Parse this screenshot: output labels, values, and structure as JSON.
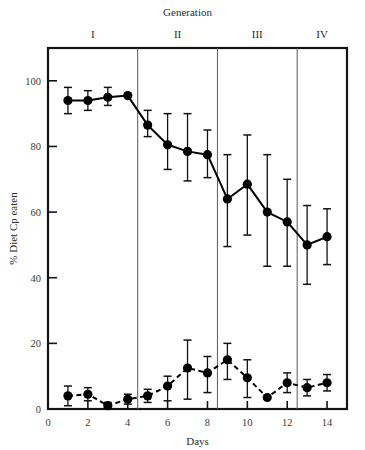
{
  "chart_data": {
    "type": "line",
    "title": "",
    "xlabel": "Days",
    "ylabel": "% Diet Cp eaten",
    "top_axis_title": "Generation",
    "xlim": [
      0,
      15
    ],
    "ylim": [
      0,
      110
    ],
    "xticks": [
      0,
      2,
      4,
      6,
      8,
      10,
      12,
      14
    ],
    "xtick_labels": [
      "0",
      "2",
      "4",
      "6",
      "8",
      "10",
      "12",
      "14"
    ],
    "yticks": [
      0,
      20,
      40,
      60,
      80,
      100
    ],
    "ytick_labels": [
      "0",
      "20",
      "40",
      "60",
      "80",
      "100"
    ],
    "grid": false,
    "legend": "none",
    "generations": [
      {
        "label": "I",
        "x_start": 0,
        "x_end": 4.5,
        "x_center": 2.25
      },
      {
        "label": "II",
        "x_start": 4.5,
        "x_end": 8.5,
        "x_center": 6.5
      },
      {
        "label": "III",
        "x_start": 8.5,
        "x_end": 12.5,
        "x_center": 10.5
      },
      {
        "label": "IV",
        "x_start": 12.5,
        "x_end": 15,
        "x_center": 13.75
      }
    ],
    "generation_dividers": [
      4.5,
      8.5,
      12.5
    ],
    "x": [
      1,
      2,
      3,
      4,
      5,
      6,
      7,
      8,
      9,
      10,
      11,
      12,
      13,
      14
    ],
    "series": [
      {
        "name": "upper",
        "linestyle": "solid",
        "marker": "filled-circle",
        "color": "#000000",
        "values": [
          94,
          94,
          95,
          95.5,
          86.5,
          80.5,
          78.5,
          77.5,
          64,
          68.5,
          60,
          57,
          50,
          52.5
        ],
        "err_low": [
          90,
          91,
          92.5,
          95.5,
          83,
          73,
          69.5,
          70.5,
          49.5,
          53,
          43.5,
          43.5,
          38,
          44
        ],
        "err_high": [
          98,
          97,
          98,
          95.5,
          91,
          90,
          90,
          85,
          77.5,
          83.5,
          77.5,
          70,
          62,
          61
        ]
      },
      {
        "name": "lower",
        "linestyle": "dashed",
        "marker": "filled-circle",
        "color": "#000000",
        "values": [
          4,
          4.5,
          1,
          3,
          4,
          7,
          12.5,
          11,
          15,
          9.5,
          3.5,
          8,
          6.5,
          8
        ],
        "err_low": [
          1,
          2.5,
          0,
          1.5,
          2,
          2.5,
          3,
          5,
          9,
          3.5,
          3.5,
          5,
          4,
          5.5
        ],
        "err_high": [
          7,
          6.5,
          2,
          4.5,
          6,
          10,
          21,
          16,
          20,
          15,
          3.5,
          11,
          9,
          10.5
        ]
      }
    ]
  }
}
